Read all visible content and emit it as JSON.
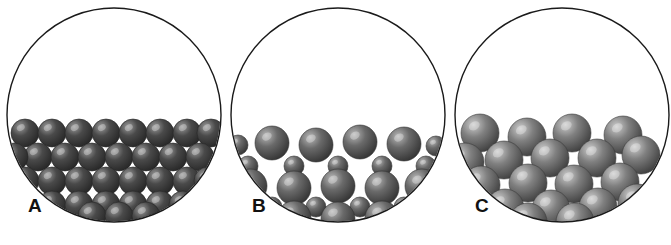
{
  "figure": {
    "background_color": "#ffffff",
    "width": 671,
    "height": 245,
    "panel_count": 3
  },
  "style": {
    "vessel_outline_color": "#1a1a1a",
    "vessel_outline_width": 1.4,
    "vessel_fill_color": "#ffffff",
    "sphere_dark_base": "#4a4a4a",
    "sphere_dark_shadow": "#262626",
    "sphere_dark_highlight": "#9a9a9a",
    "sphere_mid_base": "#6a6a6a",
    "sphere_mid_shadow": "#333333",
    "sphere_mid_highlight": "#b8b8b8",
    "sphere_light_base": "#808080",
    "sphere_light_shadow": "#3d3d3d",
    "sphere_light_highlight": "#cccccc",
    "label_color": "#111111"
  },
  "panels": [
    {
      "id": "panel-a",
      "label": "A",
      "label_x": 28,
      "label_y": 196,
      "packing_type": "ordered close packing, uniform small spheres",
      "surface": "flat and level",
      "vessel": {
        "cx": 114,
        "cy": 115,
        "r": 107
      },
      "spheres": [
        {
          "cx": 25,
          "cy": 133,
          "r": 14,
          "tone": "dark"
        },
        {
          "cx": 52,
          "cy": 133,
          "r": 14,
          "tone": "dark"
        },
        {
          "cx": 79,
          "cy": 133,
          "r": 14,
          "tone": "dark"
        },
        {
          "cx": 106,
          "cy": 133,
          "r": 14,
          "tone": "dark"
        },
        {
          "cx": 133,
          "cy": 133,
          "r": 14,
          "tone": "dark"
        },
        {
          "cx": 160,
          "cy": 133,
          "r": 14,
          "tone": "dark"
        },
        {
          "cx": 187,
          "cy": 133,
          "r": 14,
          "tone": "dark"
        },
        {
          "cx": 211,
          "cy": 133,
          "r": 14,
          "tone": "dark"
        },
        {
          "cx": 38,
          "cy": 157,
          "r": 14,
          "tone": "dark"
        },
        {
          "cx": 65,
          "cy": 157,
          "r": 14,
          "tone": "dark"
        },
        {
          "cx": 92,
          "cy": 157,
          "r": 14,
          "tone": "dark"
        },
        {
          "cx": 119,
          "cy": 157,
          "r": 14,
          "tone": "dark"
        },
        {
          "cx": 146,
          "cy": 157,
          "r": 14,
          "tone": "dark"
        },
        {
          "cx": 173,
          "cy": 157,
          "r": 14,
          "tone": "dark"
        },
        {
          "cx": 200,
          "cy": 157,
          "r": 14,
          "tone": "dark"
        },
        {
          "cx": 14,
          "cy": 157,
          "r": 14,
          "tone": "dark"
        },
        {
          "cx": 25,
          "cy": 181,
          "r": 14,
          "tone": "dark"
        },
        {
          "cx": 52,
          "cy": 181,
          "r": 14,
          "tone": "dark"
        },
        {
          "cx": 79,
          "cy": 181,
          "r": 14,
          "tone": "dark"
        },
        {
          "cx": 106,
          "cy": 181,
          "r": 14,
          "tone": "dark"
        },
        {
          "cx": 133,
          "cy": 181,
          "r": 14,
          "tone": "dark"
        },
        {
          "cx": 160,
          "cy": 181,
          "r": 14,
          "tone": "dark"
        },
        {
          "cx": 187,
          "cy": 181,
          "r": 14,
          "tone": "dark"
        },
        {
          "cx": 208,
          "cy": 181,
          "r": 14,
          "tone": "dark"
        },
        {
          "cx": 52,
          "cy": 205,
          "r": 14,
          "tone": "dark"
        },
        {
          "cx": 79,
          "cy": 205,
          "r": 14,
          "tone": "dark"
        },
        {
          "cx": 106,
          "cy": 205,
          "r": 14,
          "tone": "dark"
        },
        {
          "cx": 133,
          "cy": 205,
          "r": 14,
          "tone": "dark"
        },
        {
          "cx": 160,
          "cy": 205,
          "r": 14,
          "tone": "dark"
        },
        {
          "cx": 183,
          "cy": 205,
          "r": 14,
          "tone": "dark"
        },
        {
          "cx": 92,
          "cy": 216,
          "r": 14,
          "tone": "dark"
        },
        {
          "cx": 119,
          "cy": 216,
          "r": 14,
          "tone": "dark"
        },
        {
          "cx": 146,
          "cy": 216,
          "r": 14,
          "tone": "dark"
        }
      ]
    },
    {
      "id": "panel-b",
      "label": "B",
      "label_x": 252,
      "label_y": 196,
      "packing_type": "binary mixture, large spheres with small spheres in interstices",
      "surface": "slightly undulating",
      "vessel": {
        "cx": 338,
        "cy": 115,
        "r": 107
      },
      "spheres": [
        {
          "cx": 238,
          "cy": 145,
          "r": 10,
          "tone": "mid"
        },
        {
          "cx": 272,
          "cy": 143,
          "r": 17,
          "tone": "mid"
        },
        {
          "cx": 316,
          "cy": 145,
          "r": 17,
          "tone": "mid"
        },
        {
          "cx": 360,
          "cy": 142,
          "r": 17,
          "tone": "mid"
        },
        {
          "cx": 404,
          "cy": 144,
          "r": 17,
          "tone": "mid"
        },
        {
          "cx": 436,
          "cy": 146,
          "r": 10,
          "tone": "mid"
        },
        {
          "cx": 248,
          "cy": 166,
          "r": 10,
          "tone": "mid"
        },
        {
          "cx": 294,
          "cy": 166,
          "r": 10,
          "tone": "mid"
        },
        {
          "cx": 338,
          "cy": 166,
          "r": 10,
          "tone": "mid"
        },
        {
          "cx": 382,
          "cy": 166,
          "r": 10,
          "tone": "mid"
        },
        {
          "cx": 426,
          "cy": 166,
          "r": 10,
          "tone": "mid"
        },
        {
          "cx": 250,
          "cy": 186,
          "r": 17,
          "tone": "mid"
        },
        {
          "cx": 294,
          "cy": 188,
          "r": 17,
          "tone": "mid"
        },
        {
          "cx": 338,
          "cy": 186,
          "r": 17,
          "tone": "mid"
        },
        {
          "cx": 382,
          "cy": 188,
          "r": 17,
          "tone": "mid"
        },
        {
          "cx": 422,
          "cy": 186,
          "r": 17,
          "tone": "mid"
        },
        {
          "cx": 272,
          "cy": 207,
          "r": 10,
          "tone": "mid"
        },
        {
          "cx": 316,
          "cy": 207,
          "r": 10,
          "tone": "mid"
        },
        {
          "cx": 360,
          "cy": 207,
          "r": 10,
          "tone": "mid"
        },
        {
          "cx": 404,
          "cy": 207,
          "r": 10,
          "tone": "mid"
        },
        {
          "cx": 294,
          "cy": 218,
          "r": 17,
          "tone": "mid"
        },
        {
          "cx": 338,
          "cy": 219,
          "r": 17,
          "tone": "mid"
        },
        {
          "cx": 382,
          "cy": 218,
          "r": 17,
          "tone": "mid"
        }
      ]
    },
    {
      "id": "panel-c",
      "label": "C",
      "label_x": 475,
      "label_y": 196,
      "packing_type": "random loose packing, uniform large spheres",
      "surface": "irregular and rough",
      "vessel": {
        "cx": 562,
        "cy": 115,
        "r": 107
      },
      "spheres": [
        {
          "cx": 480,
          "cy": 133,
          "r": 19,
          "tone": "light"
        },
        {
          "cx": 527,
          "cy": 137,
          "r": 19,
          "tone": "light"
        },
        {
          "cx": 572,
          "cy": 133,
          "r": 19,
          "tone": "light"
        },
        {
          "cx": 623,
          "cy": 135,
          "r": 19,
          "tone": "light"
        },
        {
          "cx": 504,
          "cy": 160,
          "r": 19,
          "tone": "light"
        },
        {
          "cx": 550,
          "cy": 158,
          "r": 19,
          "tone": "light"
        },
        {
          "cx": 597,
          "cy": 158,
          "r": 19,
          "tone": "light"
        },
        {
          "cx": 641,
          "cy": 155,
          "r": 19,
          "tone": "light"
        },
        {
          "cx": 465,
          "cy": 162,
          "r": 19,
          "tone": "light"
        },
        {
          "cx": 481,
          "cy": 185,
          "r": 19,
          "tone": "light"
        },
        {
          "cx": 528,
          "cy": 183,
          "r": 19,
          "tone": "light"
        },
        {
          "cx": 574,
          "cy": 184,
          "r": 19,
          "tone": "light"
        },
        {
          "cx": 620,
          "cy": 182,
          "r": 19,
          "tone": "light"
        },
        {
          "cx": 505,
          "cy": 208,
          "r": 19,
          "tone": "light"
        },
        {
          "cx": 551,
          "cy": 209,
          "r": 19,
          "tone": "light"
        },
        {
          "cx": 598,
          "cy": 207,
          "r": 19,
          "tone": "light"
        },
        {
          "cx": 463,
          "cy": 206,
          "r": 19,
          "tone": "light"
        },
        {
          "cx": 637,
          "cy": 203,
          "r": 19,
          "tone": "light"
        },
        {
          "cx": 528,
          "cy": 222,
          "r": 19,
          "tone": "light"
        },
        {
          "cx": 575,
          "cy": 222,
          "r": 19,
          "tone": "light"
        }
      ]
    }
  ]
}
